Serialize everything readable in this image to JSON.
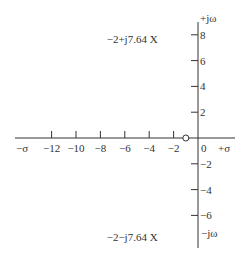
{
  "chart_data": {
    "type": "scatter",
    "title": "",
    "xlabel_neg": "−σ",
    "xlabel_pos": "+σ",
    "ylabel_pos": "+jω",
    "ylabel_neg": "−jω",
    "xlim": [
      -14.5,
      3
    ],
    "ylim": [
      -8,
      8.5
    ],
    "x_ticks": [
      -12,
      -10,
      -8,
      -6,
      -4,
      -2
    ],
    "x_tick_labels": [
      "−12",
      "−10",
      "−8",
      "−6",
      "−4",
      "−2"
    ],
    "origin_label": "0",
    "y_ticks": [
      8,
      6,
      4,
      2,
      -2,
      -4,
      -6
    ],
    "y_tick_labels": [
      "8",
      "6",
      "4",
      "2",
      "−2",
      "−4",
      "−6"
    ],
    "poles": [
      {
        "re": -2,
        "im": 7.64,
        "label": "−2+j7.64",
        "marker": "X"
      },
      {
        "re": -2,
        "im": -7.64,
        "label": "−2−j7.64",
        "marker": "X"
      }
    ],
    "zeros": [
      {
        "re": -1,
        "im": 0,
        "marker": "o"
      }
    ],
    "grid": false
  }
}
